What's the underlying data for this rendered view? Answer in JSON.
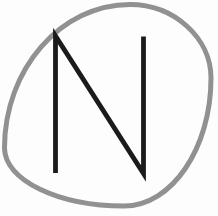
{
  "logo": {
    "letter": "N",
    "colors": {
      "background": "#fdfdfd",
      "ring": "#919191",
      "letter": "#1b1b1b"
    }
  }
}
